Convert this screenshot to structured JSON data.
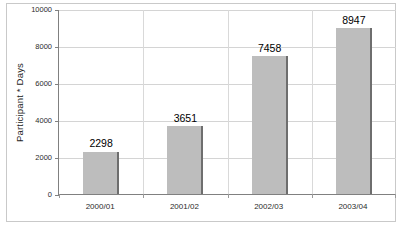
{
  "chart_data": {
    "type": "bar",
    "title": "",
    "subtitle": "",
    "xlabel": "",
    "ylabel": "Participant * Days",
    "categories": [
      "2000/01",
      "2001/02",
      "2002/03",
      "2003/04"
    ],
    "values": [
      2298,
      3651,
      7458,
      8947
    ],
    "data_labels": [
      "2298",
      "3651",
      "7458",
      "8947"
    ],
    "ylim": [
      0,
      10000
    ],
    "ytick_values": [
      0,
      2000,
      4000,
      6000,
      8000,
      10000
    ],
    "ytick_labels": [
      "0",
      "2000",
      "4000",
      "6000",
      "8000",
      "10000"
    ],
    "grid": "horizontal-and-vertical",
    "legend": "none",
    "series": [
      {
        "name": "Participant * Days",
        "values": [
          2298,
          3651,
          7458,
          8947
        ]
      }
    ],
    "colors": {
      "bar_fill": "#bdbdbd",
      "bar_edge": "#6e6e6e",
      "gridline": "#d4d4d4",
      "axis_line": "#808080",
      "text": "#000000",
      "background": "#ffffff",
      "frame_border": "#c9c9c9"
    }
  }
}
